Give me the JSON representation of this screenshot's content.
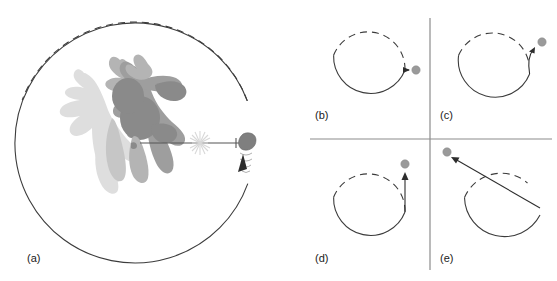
{
  "figure": {
    "background_color": "#ffffff",
    "stroke_color": "#3c3c3c",
    "ball_color": "#9a9a9a",
    "divider_color": "#8c8c8c"
  },
  "panels": [
    {
      "id": "a",
      "label": "(a)",
      "description": "Skater swinging a puck on a string around a circular path, puck at release point",
      "circle": {
        "cx": 135,
        "cy": 142,
        "r": 120
      },
      "dashed_arc_from_deg": 200,
      "dashed_arc_to_deg": 350,
      "has_figure": true,
      "has_starburst": true,
      "has_direction_arrow": true
    },
    {
      "id": "b",
      "label": "(b)",
      "description": "Puck travels straight outward radially from the circle",
      "circle": {
        "cx": 368,
        "cy": 70,
        "r": 37
      },
      "ball": {
        "cx": 416,
        "cy": 70,
        "r": 4
      },
      "trajectory": "radial-straight"
    },
    {
      "id": "c",
      "label": "(c)",
      "description": "Puck follows a curved spiral outward from the circle",
      "circle": {
        "cx": 493,
        "cy": 70,
        "r": 37
      },
      "ball": {
        "cx": 542,
        "cy": 42,
        "r": 4
      },
      "trajectory": "curved-spiral"
    },
    {
      "id": "d",
      "label": "(d)",
      "description": "Puck travels straight along the tangent, vertically upward",
      "circle": {
        "cx": 368,
        "cy": 212,
        "r": 37
      },
      "ball": {
        "cx": 405,
        "cy": 164,
        "r": 4
      },
      "trajectory": "tangent-vertical"
    },
    {
      "id": "e",
      "label": "(e)",
      "description": "Puck travels along a straight chord cutting across the circle",
      "circle": {
        "cx": 500,
        "cy": 215,
        "r": 40
      },
      "ball": {
        "cx": 447,
        "cy": 152,
        "r": 4
      },
      "trajectory": "chord-straight"
    }
  ],
  "dividers": {
    "horizontal": {
      "x1": 310,
      "y1": 139,
      "x2": 552,
      "y2": 139
    },
    "vertical": {
      "x1": 430,
      "y1": 18,
      "x2": 430,
      "y2": 270
    }
  },
  "labels": {
    "a": "(a)",
    "b": "(b)",
    "c": "(c)",
    "d": "(d)",
    "e": "(e)"
  }
}
